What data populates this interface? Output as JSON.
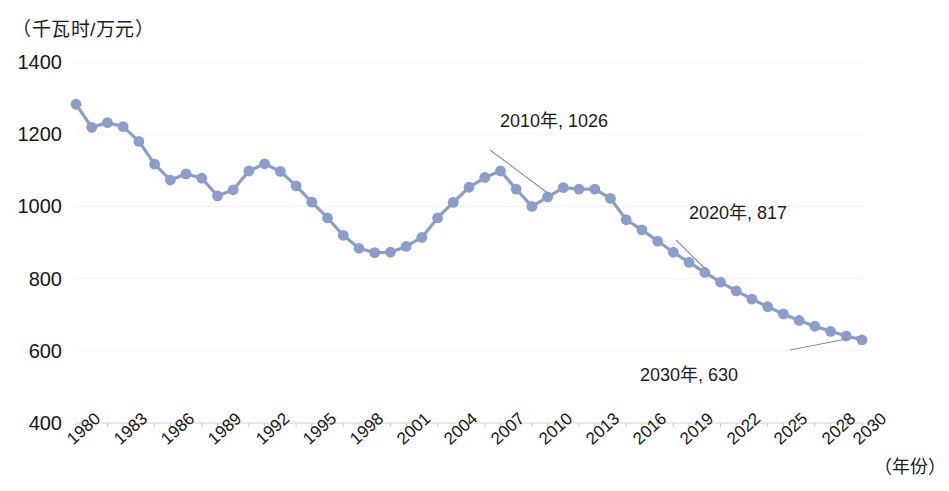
{
  "chart_data": {
    "type": "line",
    "title": "",
    "subtitle": "",
    "ylabel": "（千瓦时/万元）",
    "xlabel": "（年份）",
    "ylim": [
      400,
      1400
    ],
    "yticks": [
      400,
      600,
      800,
      1000,
      1200,
      1400
    ],
    "xlim": [
      1980,
      2030
    ],
    "xticks": [
      "1980",
      "1983",
      "1986",
      "1989",
      "1992",
      "1995",
      "1998",
      "2001",
      "2004",
      "2007",
      "2010",
      "2013",
      "2016",
      "2019",
      "2022",
      "2025",
      "2028",
      "2030"
    ],
    "grid": true,
    "legend": "none",
    "series": [
      {
        "name": "单位GDP电耗",
        "color": "#8a9dcd",
        "x": [
          1980,
          1981,
          1982,
          1983,
          1984,
          1985,
          1986,
          1987,
          1988,
          1989,
          1990,
          1991,
          1992,
          1993,
          1994,
          1995,
          1996,
          1997,
          1998,
          1999,
          2000,
          2001,
          2002,
          2003,
          2004,
          2005,
          2006,
          2007,
          2008,
          2009,
          2010,
          2011,
          2012,
          2013,
          2014,
          2015,
          2016,
          2017,
          2018,
          2019,
          2020,
          2021,
          2022,
          2023,
          2024,
          2025,
          2026,
          2027,
          2028,
          2029,
          2030
        ],
        "values": [
          1283,
          1219,
          1232,
          1221,
          1180,
          1117,
          1073,
          1090,
          1078,
          1029,
          1046,
          1098,
          1118,
          1097,
          1057,
          1012,
          968,
          920,
          884,
          872,
          873,
          889,
          914,
          968,
          1011,
          1053,
          1080,
          1098,
          1048,
          1000,
          1026,
          1052,
          1048,
          1048,
          1022,
          963,
          935,
          904,
          873,
          845,
          817,
          790,
          766,
          743,
          722,
          702,
          684,
          668,
          654,
          641,
          630
        ]
      }
    ],
    "annotations": [
      {
        "label": "2010年, 1026",
        "year": 2010,
        "value": 1026
      },
      {
        "label": "2020年, 817",
        "year": 2020,
        "value": 817
      },
      {
        "label": "2030年, 630",
        "year": 2030,
        "value": 630
      }
    ]
  }
}
